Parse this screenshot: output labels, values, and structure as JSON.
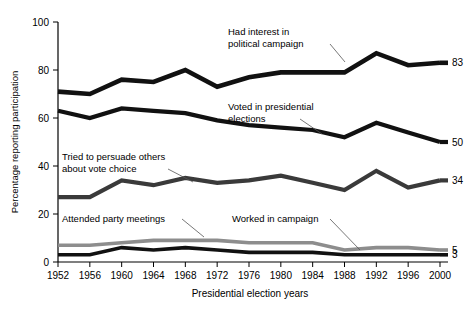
{
  "chart_data": {
    "type": "line",
    "title": "",
    "xlabel": "Presidential election years",
    "ylabel": "Percentage reporting participation",
    "xlim": [
      1952,
      2000
    ],
    "ylim": [
      0,
      100
    ],
    "yticks": [
      0,
      20,
      40,
      60,
      80,
      100
    ],
    "grid": false,
    "legend": "inline-annotations",
    "x": [
      1952,
      1956,
      1960,
      1964,
      1968,
      1972,
      1976,
      1980,
      1984,
      1988,
      1992,
      1996,
      2000
    ],
    "xticklabels": [
      "1952",
      "1956",
      "1960",
      "1964",
      "1968",
      "1972",
      "1976",
      "1980",
      "1984",
      "1988",
      "1992",
      "1996",
      "2000"
    ],
    "series": [
      {
        "name": "Had interest in political campaign",
        "color": "#111111",
        "width": 4.6,
        "end_label": "83",
        "values": [
          71,
          70,
          76,
          75,
          80,
          73,
          77,
          79,
          79,
          79,
          87,
          82,
          83
        ]
      },
      {
        "name": "Voted in presidential elections",
        "color": "#111111",
        "width": 4.2,
        "end_label": "50",
        "values": [
          63,
          60,
          64,
          63,
          62,
          59,
          57,
          56,
          55,
          52,
          58,
          54,
          50
        ]
      },
      {
        "name": "Tried to persuade others about vote choice",
        "color": "#3a3a3a",
        "width": 4.2,
        "end_label": "34",
        "values": [
          27,
          27,
          34,
          32,
          35,
          33,
          34,
          36,
          33,
          30,
          38,
          31,
          34
        ]
      },
      {
        "name": "Attended party meetings",
        "color": "#8d8d8d",
        "width": 3.6,
        "end_label": "5",
        "values": [
          7,
          7,
          8,
          9,
          9,
          9,
          8,
          8,
          8,
          5,
          6,
          6,
          5
        ]
      },
      {
        "name": "Worked in campaign",
        "color": "#111111",
        "width": 3.6,
        "end_label": "3",
        "values": [
          3,
          3,
          6,
          5,
          6,
          5,
          4,
          4,
          4,
          3,
          3,
          3,
          3
        ]
      }
    ],
    "annotations": [
      {
        "id": "had-interest",
        "lines": [
          "Had interest in",
          "political campaign"
        ],
        "text_x": 228,
        "text_y": 35,
        "leader": [
          [
            330,
            44
          ],
          [
            345,
            62
          ]
        ]
      },
      {
        "id": "voted-presidential",
        "lines": [
          "Voted in presidential",
          "elections"
        ],
        "text_x": 228,
        "text_y": 110,
        "leader": [
          [
            300,
            119
          ],
          [
            322,
            134
          ]
        ]
      },
      {
        "id": "tried-persuade",
        "lines": [
          "Tried to persuade others",
          "about vote choice"
        ],
        "text_x": 62,
        "text_y": 160,
        "leader": [
          [
            168,
            169
          ],
          [
            193,
            182
          ]
        ]
      },
      {
        "id": "attended-meetings",
        "lines": [
          "Attended party meetings"
        ],
        "text_x": 62,
        "text_y": 222,
        "leader": [
          [
            182,
            219
          ],
          [
            204,
            237
          ]
        ]
      },
      {
        "id": "worked-campaign",
        "lines": [
          "Worked in campaign"
        ],
        "text_x": 232,
        "text_y": 222,
        "leader": [
          [
            330,
            219
          ],
          [
            360,
            250
          ]
        ]
      }
    ]
  },
  "axes": {
    "y_axis_title": "Percentage reporting participation",
    "x_axis_title": "Presidential election years"
  }
}
